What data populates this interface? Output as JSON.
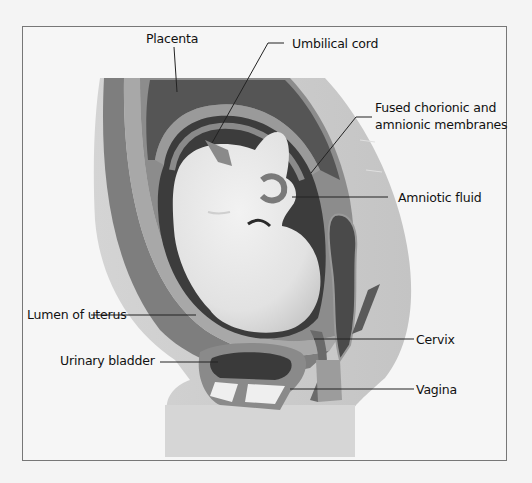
{
  "diagram": {
    "type": "anatomical-illustration",
    "labels": [
      {
        "id": "placenta",
        "text": "Placenta"
      },
      {
        "id": "umbilical_cord",
        "text": "Umbilical cord"
      },
      {
        "id": "fused_membranes_line1",
        "text": "Fused chorionic and"
      },
      {
        "id": "fused_membranes_line2",
        "text": "amnionic membranes"
      },
      {
        "id": "amniotic_fluid",
        "text": "Amniotic fluid"
      },
      {
        "id": "lumen_of_uterus",
        "text": "Lumen of uterus"
      },
      {
        "id": "cervix",
        "text": "Cervix"
      },
      {
        "id": "urinary_bladder",
        "text": "Urinary bladder"
      },
      {
        "id": "vagina",
        "text": "Vagina"
      }
    ],
    "colors": {
      "background": "#f6f6f6",
      "body_silhouette": "#cfcfcf",
      "uterine_wall": "#8a8a8a",
      "placenta": "#5a5a5a",
      "amniotic_fluid": "#3a3a3a",
      "fetus": "#e6e6e6",
      "leader_line": "#222222"
    }
  }
}
